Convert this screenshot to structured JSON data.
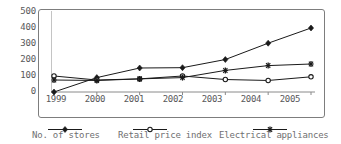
{
  "chart_data": {
    "type": "line",
    "title": "",
    "xlabel": "",
    "ylabel": "",
    "categories": [
      "1999",
      "2000",
      "2001",
      "2002",
      "2003",
      "2004",
      "2005"
    ],
    "ylim": [
      0,
      500
    ],
    "yticks": [
      "0",
      "100",
      "200",
      "300",
      "400",
      "500"
    ],
    "grid": false,
    "legend_position": "bottom",
    "series": [
      {
        "name": "No. of stores",
        "marker": "filled-diamond",
        "color": "#1a1a1a",
        "values": [
          0,
          90,
          150,
          152,
          203,
          305,
          400
        ]
      },
      {
        "name": "Retail price index",
        "marker": "open-circle",
        "color": "#1a1a1a",
        "values": [
          100,
          75,
          82,
          100,
          78,
          72,
          95
        ]
      },
      {
        "name": "Electrical appliances",
        "marker": "asterisk",
        "color": "#1a1a1a",
        "values": [
          75,
          72,
          82,
          90,
          135,
          165,
          175
        ]
      }
    ]
  },
  "axis": {
    "y_tick_0": "0",
    "y_tick_1": "100",
    "y_tick_2": "200",
    "y_tick_3": "300",
    "y_tick_4": "400",
    "y_tick_5": "500",
    "x_tick_0": "1999",
    "x_tick_1": "2000",
    "x_tick_2": "2001",
    "x_tick_3": "2002",
    "x_tick_4": "2003",
    "x_tick_5": "2004",
    "x_tick_6": "2005"
  },
  "legend": {
    "items": [
      {
        "label": "No. of stores",
        "marker": "filled-diamond"
      },
      {
        "label": "Retail price index",
        "marker": "open-circle"
      },
      {
        "label": "Electrical appliances",
        "marker": "asterisk"
      }
    ]
  }
}
